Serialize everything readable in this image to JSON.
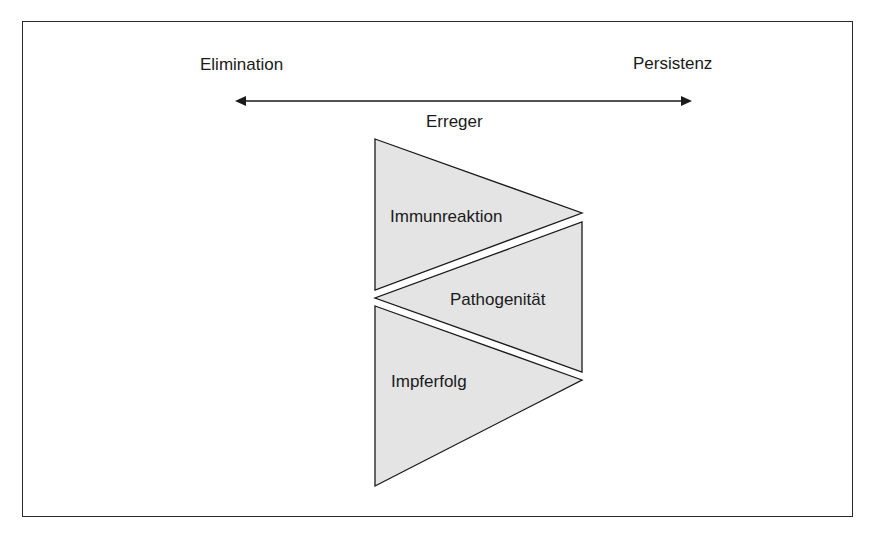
{
  "diagram": {
    "axis": {
      "left_label": "Elimination",
      "right_label": "Persistenz",
      "center_label": "Erreger",
      "direction": "bidirectional"
    },
    "triangles": [
      {
        "label": "Immunreaktion",
        "orientation": "pointing-right"
      },
      {
        "label": "Pathogenität",
        "orientation": "pointing-left"
      },
      {
        "label": "Impferfolg",
        "orientation": "pointing-right"
      }
    ],
    "colors": {
      "fill": "#e4e4e4",
      "stroke": "#1a1a1a",
      "text": "#1a1a1a"
    }
  }
}
